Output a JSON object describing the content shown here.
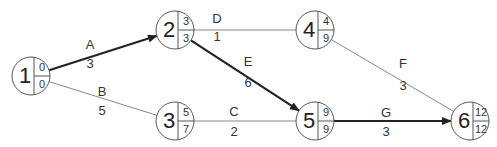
{
  "diagram": {
    "type": "network-activity-on-arrow",
    "nodes": [
      {
        "id": "1",
        "x": 31,
        "y": 76,
        "early": "0",
        "late": "0"
      },
      {
        "id": "2",
        "x": 175,
        "y": 30,
        "early": "3",
        "late": "3"
      },
      {
        "id": "3",
        "x": 175,
        "y": 121,
        "early": "5",
        "late": "7"
      },
      {
        "id": "4",
        "x": 315,
        "y": 30,
        "early": "4",
        "late": "9"
      },
      {
        "id": "5",
        "x": 315,
        "y": 121,
        "early": "9",
        "late": "9"
      },
      {
        "id": "6",
        "x": 470,
        "y": 121,
        "early": "12",
        "late": "12"
      }
    ],
    "edges": [
      {
        "label": "A",
        "duration": "3",
        "from": "1",
        "to": "2",
        "critical": true,
        "lx": 90,
        "ly": 46,
        "dx": 90,
        "dy": 65
      },
      {
        "label": "B",
        "duration": "5",
        "from": "1",
        "to": "3",
        "critical": false,
        "lx": 102,
        "ly": 93,
        "dx": 102,
        "dy": 112
      },
      {
        "label": "D",
        "duration": "1",
        "from": "2",
        "to": "4",
        "critical": false,
        "lx": 217,
        "ly": 20,
        "dx": 217,
        "dy": 38
      },
      {
        "label": "E",
        "duration": "6",
        "from": "2",
        "to": "5",
        "critical": true,
        "lx": 248,
        "ly": 63,
        "dx": 248,
        "dy": 84
      },
      {
        "label": "C",
        "duration": "2",
        "from": "3",
        "to": "5",
        "critical": false,
        "lx": 234,
        "ly": 113,
        "dx": 234,
        "dy": 133
      },
      {
        "label": "F",
        "duration": "3",
        "from": "4",
        "to": "6",
        "critical": false,
        "lx": 403,
        "ly": 65,
        "dx": 403,
        "dy": 87
      },
      {
        "label": "G",
        "duration": "3",
        "from": "5",
        "to": "6",
        "critical": true,
        "lx": 386,
        "ly": 114,
        "dx": 386,
        "dy": 133
      }
    ],
    "colors": {
      "critical": "#222222",
      "normal": "#888888",
      "node_stroke": "#555555"
    }
  }
}
